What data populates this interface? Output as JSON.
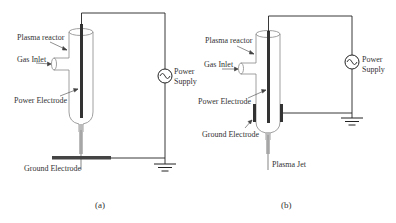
{
  "diagram_a": {
    "caption": "(a)",
    "labels": {
      "plasma_reactor": "Plasma reactor",
      "gas_inlet": "Gas Inlet",
      "power_electrode": "Power Electrode",
      "ground_electrode": "Ground Electrode",
      "power_supply_line1": "Power",
      "power_supply_line2": "Supply"
    }
  },
  "diagram_b": {
    "caption": "(b)",
    "labels": {
      "plasma_reactor": "Plasma reactor",
      "gas_inlet": "Gas Inlet",
      "power_electrode": "Power Electrode",
      "ground_electrode": "Ground Electrode",
      "plasma_jet": "Plasma Jet",
      "power_supply_line1": "Power",
      "power_supply_line2": "Supply"
    }
  },
  "colors": {
    "wire": "#222222",
    "electrode": "#333333",
    "tube": "#888888",
    "jet": "#aaaaaa",
    "text": "#333333"
  }
}
